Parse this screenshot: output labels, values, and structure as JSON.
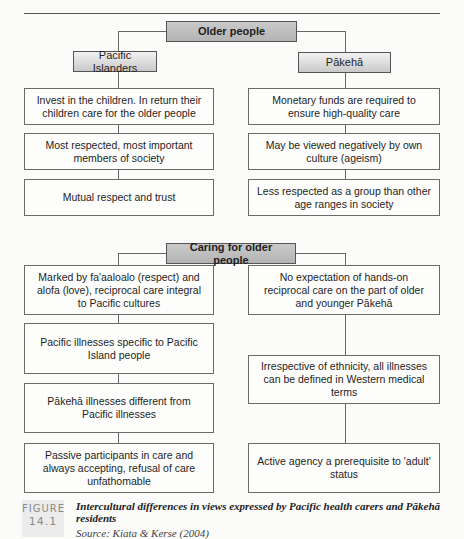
{
  "diagram": {
    "section1": {
      "title": "Older people",
      "left_group": {
        "title": "Pacific Islanders",
        "items": [
          "Invest in the children. In return their children care for the older people",
          "Most respected, most important members of society",
          "Mutual respect and trust"
        ]
      },
      "right_group": {
        "title": "Pākehā",
        "items": [
          "Monetary funds are required to ensure high-quality care",
          "May be viewed negatively by own culture (ageism)",
          "Less respected as a group than other age ranges in society"
        ]
      }
    },
    "section2": {
      "title": "Caring for older people",
      "left_items": [
        "Marked by fa'aaloalo (respect) and alofa (love), reciprocal care integral to Pacific cultures",
        "Pacific illnesses specific to Pacific Island people",
        "Pākehā illnesses different from Pacific illnesses",
        "Passive participants in care and always accepting, refusal of care unfathomable"
      ],
      "right_items": [
        "No expectation of hands-on reciprocal care on the part of older and younger Pākehā",
        "Irrespective of ethnicity, all illnesses can be defined in Western medical terms",
        "Active agency a prerequisite to 'adult' status"
      ]
    }
  },
  "figure": {
    "label_word": "FIGURE",
    "label_number": "14.1",
    "caption": "Intercultural differences in views expressed by Pacific health carers and Pākehā residents",
    "source": "Source: Kiata & Kerse (2004)"
  },
  "colors": {
    "header_fill": "#bdbdbd",
    "box_border": "#6a6a6a"
  }
}
